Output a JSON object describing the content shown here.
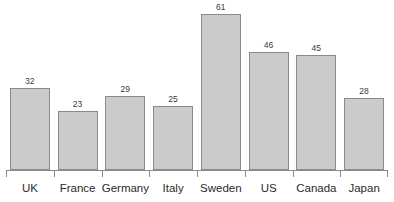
{
  "chart_data": {
    "type": "bar",
    "title": "",
    "subtitle": "",
    "xlabel": "",
    "ylabel": "",
    "categories": [
      "UK",
      "France",
      "Germany",
      "Italy",
      "Sweden",
      "US",
      "Canada",
      "Japan"
    ],
    "values": [
      32,
      23,
      29,
      25,
      61,
      46,
      45,
      28
    ],
    "value_labels": [
      "32",
      "23",
      "29",
      "25",
      "61",
      "46",
      "45",
      "28"
    ],
    "ylim": [
      0,
      61
    ],
    "grid": false,
    "legend": null,
    "legend_position": "none",
    "annotations": [],
    "axis": {
      "x_axis_visible": true,
      "y_axis_visible": false,
      "tick_marks": "between-and-around-categories",
      "tick_labels": [
        "UK",
        "France",
        "Germany",
        "Italy",
        "Sweden",
        "US",
        "Canada",
        "Japan"
      ]
    },
    "style": {
      "bar_fill": "#cbcbcb",
      "bar_border": "#8a8a8a",
      "axis_color": "#8a8a8a",
      "value_label_color": "#3a3a3a",
      "category_label_color": "#2b2b2b",
      "background": "#ffffff"
    }
  }
}
